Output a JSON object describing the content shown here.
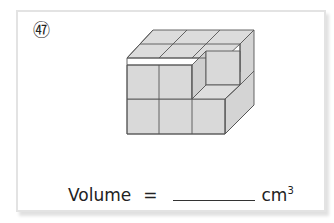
{
  "problem": {
    "number_label": "52",
    "number_glyph": "㊼"
  },
  "figure": {
    "width_cubes": 3,
    "depth_cubes": 2,
    "height_cubes": 2,
    "missing_cubes": 1,
    "face_color": "#d9d9d9",
    "edge_color": "#555555"
  },
  "answer": {
    "label": "Volume",
    "equals": "=",
    "blank_value": "",
    "unit": "cm",
    "unit_exponent": "3"
  },
  "colors": {
    "card_border": "#e3e3e3",
    "text": "#222222"
  }
}
